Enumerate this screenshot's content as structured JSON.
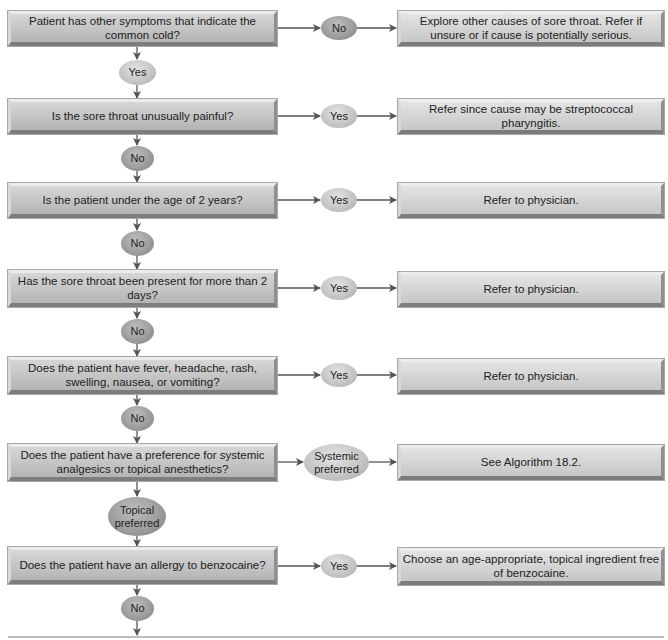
{
  "diagram": {
    "type": "flowchart",
    "colors": {
      "question_box": "#c4c4c4",
      "outcome_box": "#d3d3d3",
      "yes_oval": "#c6c6c6",
      "no_oval": "#9e9e9e",
      "arrow": "#555555"
    },
    "rows": [
      {
        "question": "Patient has other symptoms that indicate the common cold?",
        "side_branch": "No",
        "outcome": "Explore other causes of sore throat. Refer if unsure or if cause is potentially serious.",
        "down_branch": "Yes"
      },
      {
        "question": "Is the sore throat unusually painful?",
        "side_branch": "Yes",
        "outcome": "Refer since cause may be streptococcal pharyngitis.",
        "down_branch": "No"
      },
      {
        "question": "Is the patient under the age of 2 years?",
        "side_branch": "Yes",
        "outcome": "Refer to physician.",
        "down_branch": "No"
      },
      {
        "question": "Has the sore throat been present for more than 2 days?",
        "side_branch": "Yes",
        "outcome": "Refer to physician.",
        "down_branch": "No"
      },
      {
        "question": "Does the patient have fever, headache, rash, swelling, nausea, or vomiting?",
        "side_branch": "Yes",
        "outcome": "Refer to physician.",
        "down_branch": "No"
      },
      {
        "question": "Does the patient have a preference for systemic analgesics or topical anesthetics?",
        "side_branch": "Systemic preferred",
        "outcome": "See Algorithm 18.2.",
        "down_branch": "Topical preferred"
      },
      {
        "question": "Does the patient have an allergy to benzocaine?",
        "side_branch": "Yes",
        "outcome": "Choose an age-appropriate, topical ingredient free of benzocaine.",
        "down_branch": "No"
      }
    ]
  }
}
